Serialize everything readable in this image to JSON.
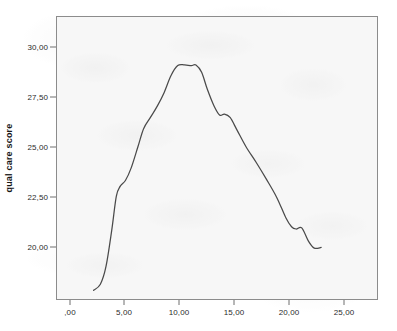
{
  "chart_data": {
    "type": "line",
    "title": "",
    "subtitle": "",
    "xlabel": "",
    "ylabel": "qual care score",
    "xlim": [
      -1.3,
      27.0
    ],
    "ylim": [
      18.75,
      31.35
    ],
    "grid": false,
    "legend": null,
    "x_tick_labels": [
      ",00",
      "5,00",
      "10,00",
      "15,00",
      "20,00",
      "25,00"
    ],
    "x_tick_values": [
      0,
      5,
      10,
      15,
      20,
      25
    ],
    "y_tick_labels": [
      "20,00",
      "22,50",
      "25,00",
      "27,50",
      "30,00"
    ],
    "y_tick_values": [
      20.0,
      22.5,
      25.0,
      27.5,
      30.0
    ],
    "series": [
      {
        "name": "qual care score",
        "color": "#4a4a4a",
        "x": [
          2.0,
          2.6,
          3.1,
          3.6,
          4.0,
          4.35,
          4.8,
          5.3,
          5.9,
          6.4,
          7.0,
          7.6,
          8.2,
          8.8,
          9.4,
          10.0,
          10.6,
          11.0,
          11.5,
          12.0,
          12.6,
          13.1,
          13.5,
          14.0,
          14.6,
          15.4,
          16.3,
          17.2,
          18.1,
          18.9,
          19.4,
          19.8,
          20.3,
          20.9,
          21.4,
          22.0
        ],
        "y": [
          19.18,
          19.45,
          20.25,
          21.85,
          23.35,
          23.8,
          24.05,
          24.6,
          25.55,
          26.35,
          26.85,
          27.35,
          27.95,
          28.7,
          29.15,
          29.18,
          29.15,
          29.18,
          28.85,
          28.1,
          27.35,
          26.95,
          27.0,
          26.85,
          26.3,
          25.55,
          24.85,
          24.1,
          23.3,
          22.4,
          22.0,
          21.9,
          21.95,
          21.35,
          21.05,
          21.08
        ]
      }
    ]
  },
  "axes": {
    "y_title": "qual care score"
  }
}
